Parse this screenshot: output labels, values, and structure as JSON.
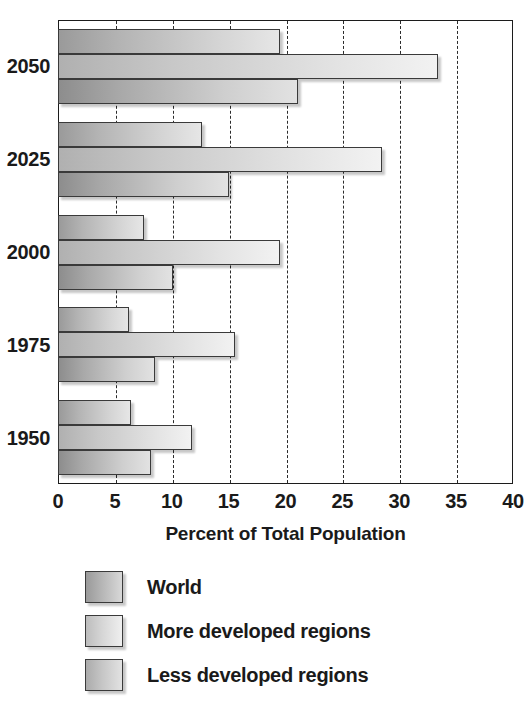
{
  "chart_data": {
    "type": "bar",
    "orientation": "horizontal",
    "title": "",
    "xlabel": "Percent of Total Population",
    "ylabel": "",
    "xlim": [
      0,
      40
    ],
    "xticks": [
      "0",
      "5",
      "10",
      "15",
      "20",
      "25",
      "30",
      "35",
      "40"
    ],
    "xtick_values": [
      0,
      5,
      10,
      15,
      20,
      25,
      30,
      35,
      40
    ],
    "grid": "vertical-dashed",
    "categories": [
      "1950",
      "1975",
      "2000",
      "2025",
      "2050"
    ],
    "category_order_top_to_bottom": [
      "2050",
      "2025",
      "2000",
      "1975",
      "1950"
    ],
    "legend_position": "below",
    "series": [
      {
        "name": "World",
        "values": [
          6.4,
          6.2,
          7.6,
          12.7,
          19.5
        ]
      },
      {
        "name": "More developed regions",
        "values": [
          11.8,
          15.6,
          19.5,
          28.5,
          33.4
        ]
      },
      {
        "name": "Less developed regions",
        "values": [
          8.2,
          8.5,
          10.1,
          15.0,
          21.1
        ]
      }
    ]
  },
  "axis": {
    "x_title": "Percent of Total Population"
  },
  "legend": {
    "items": [
      {
        "label": "World",
        "swatch": "series-world"
      },
      {
        "label": "More developed regions",
        "swatch": "series-more"
      },
      {
        "label": "Less developed regions",
        "swatch": "series-less"
      }
    ]
  },
  "colors": {
    "frame": "#1c1c1c",
    "gridline": "#2b2b2b",
    "text": "#1a1a1a",
    "background": "#ffffff",
    "series_world": "#b4b4b4",
    "series_more_developed": "#dcdcdc",
    "series_less_developed": "#c2c2c2"
  }
}
